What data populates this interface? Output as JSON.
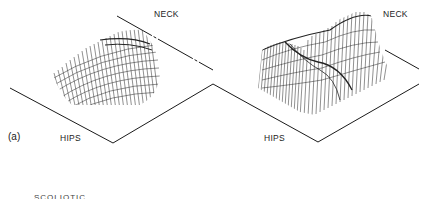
{
  "figure": {
    "panel_label": "(a)",
    "left_plot": {
      "neck_label": "NECK",
      "hips_label": "HIPS"
    },
    "right_plot": {
      "neck_label": "NECK",
      "hips_label": "HIPS"
    },
    "bottom_caption": "SCOLIOTIC",
    "colors": {
      "line": "#1a1a1a",
      "background": "#ffffff"
    }
  }
}
